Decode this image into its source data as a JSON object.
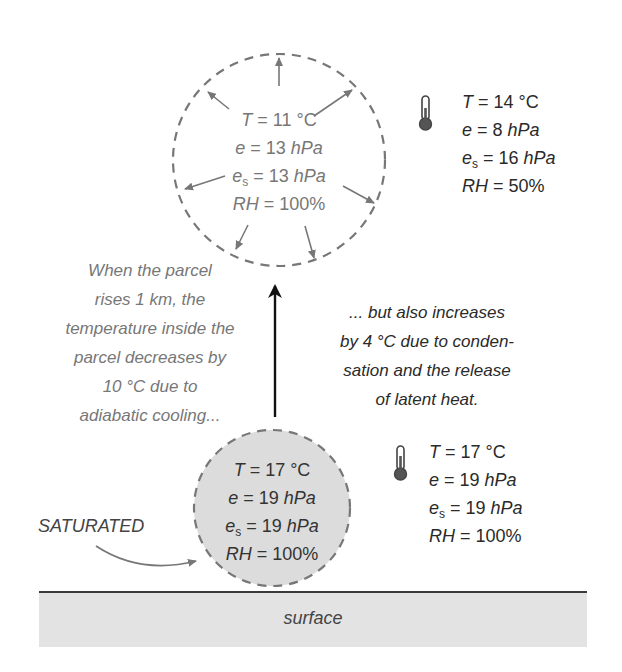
{
  "upper_parcel": {
    "T_label": "T",
    "T_value": "= 11 °C",
    "e_label": "e",
    "e_value": "= 13",
    "e_unit": "hPa",
    "es_label": "e",
    "es_sub": "s",
    "es_value": "= 13",
    "es_unit": "hPa",
    "RH_label": "RH",
    "RH_value": "= 100%"
  },
  "upper_environment": {
    "icon": "thermometer-icon",
    "T_label": "T",
    "T_value": "= 14 °C",
    "e_label": "e",
    "e_value": "= 8",
    "e_unit": "hPa",
    "es_label": "e",
    "es_sub": "s",
    "es_value": "= 16",
    "es_unit": "hPa",
    "RH_label": "RH",
    "RH_value": "= 50%"
  },
  "lower_parcel": {
    "T_label": "T",
    "T_value": "= 17 °C",
    "e_label": "e",
    "e_value": "= 19",
    "e_unit": "hPa",
    "es_label": "e",
    "es_sub": "s",
    "es_value": "= 19",
    "es_unit": "hPa",
    "RH_label": "RH",
    "RH_value": "= 100%"
  },
  "lower_environment": {
    "icon": "thermometer-icon",
    "T_label": "T",
    "T_value": "= 17 °C",
    "e_label": "e",
    "e_value": "= 19",
    "e_unit": "hPa",
    "es_label": "e",
    "es_sub": "s",
    "es_value": "= 19",
    "es_unit": "hPa",
    "RH_label": "RH",
    "RH_value": "= 100%"
  },
  "notes": {
    "left": [
      "When the parcel",
      "rises 1 km, the",
      "temperature inside the",
      "parcel decreases by",
      "10 °C due to",
      "adiabatic cooling..."
    ],
    "right": [
      "... but also increases",
      "by 4 °C due to conden-",
      "sation and the release",
      "of latent heat."
    ]
  },
  "saturated_label": "SATURATED",
  "surface_label": "surface",
  "colors": {
    "dash": "#777777",
    "parcel_fill": "#dcdcdc",
    "surface_fill": "#e3e3e3",
    "surface_line": "#3a3a3a",
    "arrow": "#111111"
  }
}
